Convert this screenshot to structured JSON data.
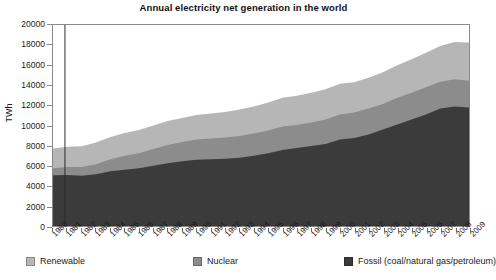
{
  "chart_data": {
    "type": "area",
    "title": "Annual electricity net generation in the world",
    "xlabel": "",
    "ylabel": "TWh",
    "stacked": true,
    "grid": false,
    "legend_position": "bottom",
    "ylim": [
      0,
      20000
    ],
    "ytick_labels": [
      "20000",
      "18000",
      "16000",
      "14000",
      "12000",
      "10000",
      "8000",
      "6000",
      "4000",
      "2000",
      "0"
    ],
    "ytick_values": [
      20000,
      18000,
      16000,
      14000,
      12000,
      10000,
      8000,
      6000,
      4000,
      2000,
      0
    ],
    "categories": [
      "1980",
      "1981",
      "1982",
      "1983",
      "1984",
      "1985",
      "1986",
      "1987",
      "1988",
      "1989",
      "1990",
      "1991",
      "1992",
      "1993",
      "1994",
      "1995",
      "1996",
      "1997",
      "1998",
      "1999",
      "2000",
      "2001",
      "2002",
      "2003",
      "2004",
      "2005",
      "2006",
      "2007",
      "2008",
      "2009"
    ],
    "x": [
      1980,
      1981,
      1982,
      1983,
      1984,
      1985,
      1986,
      1987,
      1988,
      1989,
      1990,
      1991,
      1992,
      1993,
      1994,
      1995,
      1996,
      1997,
      1998,
      1999,
      2000,
      2001,
      2002,
      2003,
      2004,
      2005,
      2006,
      2007,
      2008,
      2009
    ],
    "series": [
      {
        "name": "Fossil (coal/natural gas/petroleum)",
        "color": "#3b3b3b",
        "values": [
          5050,
          5080,
          5000,
          5150,
          5450,
          5600,
          5750,
          6000,
          6250,
          6450,
          6600,
          6650,
          6700,
          6800,
          7000,
          7250,
          7550,
          7750,
          7950,
          8150,
          8600,
          8750,
          9100,
          9600,
          10100,
          10600,
          11100,
          11700,
          11900,
          11800
        ]
      },
      {
        "name": "Nuclear",
        "color": "#8c8c8c",
        "values": [
          700,
          800,
          880,
          1000,
          1200,
          1400,
          1500,
          1650,
          1800,
          1900,
          2000,
          2050,
          2100,
          2150,
          2200,
          2250,
          2350,
          2300,
          2350,
          2450,
          2500,
          2550,
          2600,
          2550,
          2650,
          2650,
          2700,
          2650,
          2700,
          2650
        ]
      },
      {
        "name": "Renewable",
        "color": "#b6b6b6",
        "values": [
          1950,
          2000,
          2050,
          2150,
          2200,
          2250,
          2300,
          2350,
          2400,
          2400,
          2450,
          2500,
          2550,
          2650,
          2700,
          2800,
          2850,
          2900,
          2950,
          3000,
          3050,
          3000,
          3050,
          3150,
          3250,
          3350,
          3450,
          3550,
          3700,
          3800
        ]
      }
    ],
    "totals": [
      7700,
      7880,
      7930,
      8300,
      8850,
      9250,
      9550,
      10000,
      10450,
      10750,
      11050,
      11200,
      11350,
      11600,
      11900,
      12300,
      12750,
      12950,
      13250,
      13600,
      14150,
      14300,
      14750,
      15300,
      16000,
      16600,
      17250,
      17900,
      18300,
      18250
    ]
  },
  "legend": {
    "items": [
      {
        "label": "Renewable",
        "swatch_name": "legend-swatch-renewable"
      },
      {
        "label": "Nuclear",
        "swatch_name": "legend-swatch-nuclear"
      },
      {
        "label": "Fossil (coal/natural gas/petroleum)",
        "swatch_name": "legend-swatch-fossil"
      }
    ]
  },
  "colors": {
    "fossil": "#3b3b3b",
    "nuclear": "#8c8c8c",
    "renewable": "#b6b6b6",
    "axis": "#8a8a8a",
    "text": "#1a1a1a",
    "background": "#ffffff"
  }
}
